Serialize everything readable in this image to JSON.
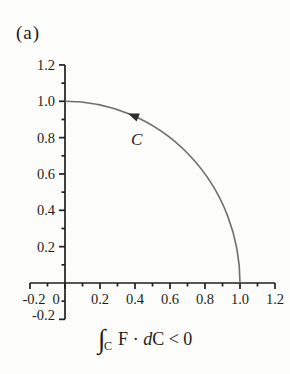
{
  "panel_label": "(a)",
  "caption": {
    "full_text": "∫C F · dC < 0",
    "segments": [
      {
        "text": "∫",
        "style": "integral"
      },
      {
        "text": "C",
        "style": "subscript"
      },
      {
        "text": "F",
        "style": "roman"
      },
      {
        "text": " · ",
        "style": "roman"
      },
      {
        "text": "d",
        "style": "italic"
      },
      {
        "text": "C < 0",
        "style": "roman"
      }
    ]
  },
  "colors": {
    "background": "#fcfcfa",
    "axis": "#1f1f1f",
    "curve": "#6e6e6e",
    "arrow": "#2e2e2e",
    "text": "#1c1c1c"
  },
  "chart_data": {
    "type": "line",
    "title": "",
    "xlabel": "",
    "ylabel": "",
    "xlim": [
      -0.2,
      1.2
    ],
    "ylim": [
      -0.2,
      1.2
    ],
    "grid": false,
    "x_major_ticks": [
      -0.2,
      0,
      0.2,
      0.4,
      0.6,
      0.8,
      1.0,
      1.2
    ],
    "x_tick_labels": [
      "-0.2",
      "0",
      "0.2",
      "0.4",
      "0.6",
      "0.8",
      "1.0",
      "1.2"
    ],
    "x_tick_label_offsets": {
      "0": -9,
      "-0.2": 4
    },
    "x_minor_ticks": [
      -0.1,
      0.1,
      0.3,
      0.5,
      0.7,
      0.9,
      1.1
    ],
    "y_major_ticks": [
      -0.2,
      0.2,
      0.4,
      0.6,
      0.8,
      1.0,
      1.2
    ],
    "y_tick_labels": [
      "-0.2",
      "0.2",
      "0.4",
      "0.6",
      "0.8",
      "1.0",
      "1.2"
    ],
    "y_tick_label_offsets": {
      "-0.2": -4
    },
    "y_minor_ticks": [
      -0.1,
      0.1,
      0.3,
      0.5,
      0.7,
      0.9,
      1.1
    ],
    "series": [
      {
        "name": "C",
        "label": "C",
        "shape": "quarter_circle",
        "radius": 1.0,
        "center": [
          0,
          0
        ],
        "start": [
          0,
          1.0
        ],
        "end": [
          1.0,
          0
        ],
        "direction": "counterclockwise",
        "arrow_at": [
          0.36,
          0.933
        ],
        "label_at": [
          0.41,
          0.76
        ],
        "points": [
          [
            0,
            1.0
          ],
          [
            0.1,
            0.995
          ],
          [
            0.2,
            0.98
          ],
          [
            0.3,
            0.954
          ],
          [
            0.4,
            0.917
          ],
          [
            0.5,
            0.866
          ],
          [
            0.6,
            0.8
          ],
          [
            0.7,
            0.714
          ],
          [
            0.8,
            0.6
          ],
          [
            0.9,
            0.436
          ],
          [
            0.95,
            0.312
          ],
          [
            1.0,
            0
          ]
        ]
      }
    ]
  }
}
